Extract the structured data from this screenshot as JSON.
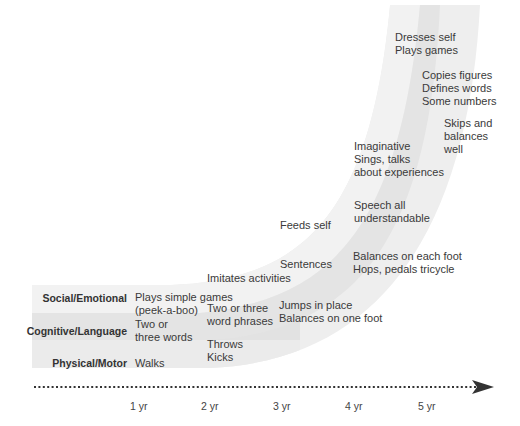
{
  "rows": {
    "social": "Social/Emotional",
    "cognitive": "Cognitive/Language",
    "physical": "Physical/Motor"
  },
  "milestones": {
    "m1": [
      "Plays simple games",
      "(peek-a-boo)"
    ],
    "m2": [
      "Two or",
      "three words"
    ],
    "m3": [
      "Walks"
    ],
    "m4": [
      "Imitates activities"
    ],
    "m5": [
      "Two or three",
      "word phrases"
    ],
    "m6": [
      "Throws",
      "Kicks"
    ],
    "m7": [
      "Feeds self"
    ],
    "m8": [
      "Sentences"
    ],
    "m9": [
      "Jumps in place",
      "Balances on one foot"
    ],
    "m10": [
      "Imaginative",
      "Sings, talks",
      "about experiences"
    ],
    "m11": [
      "Speech all",
      "understandable"
    ],
    "m12": [
      "Balances on each foot",
      "Hops, pedals tricycle"
    ],
    "m13": [
      "Dresses self",
      "Plays games"
    ],
    "m14": [
      "Copies figures",
      "Defines words",
      "Some numbers"
    ],
    "m15": [
      "Skips and",
      "balances",
      "well"
    ]
  },
  "axis": {
    "ticks": [
      "1 yr",
      "2 yr",
      "3 yr",
      "4 yr",
      "5 yr"
    ]
  },
  "colors": {
    "band_light": "#f0f0f0",
    "band_mid": "#e6e6e6",
    "band_dark": "#dcdcdc",
    "arrow": "#333333"
  }
}
